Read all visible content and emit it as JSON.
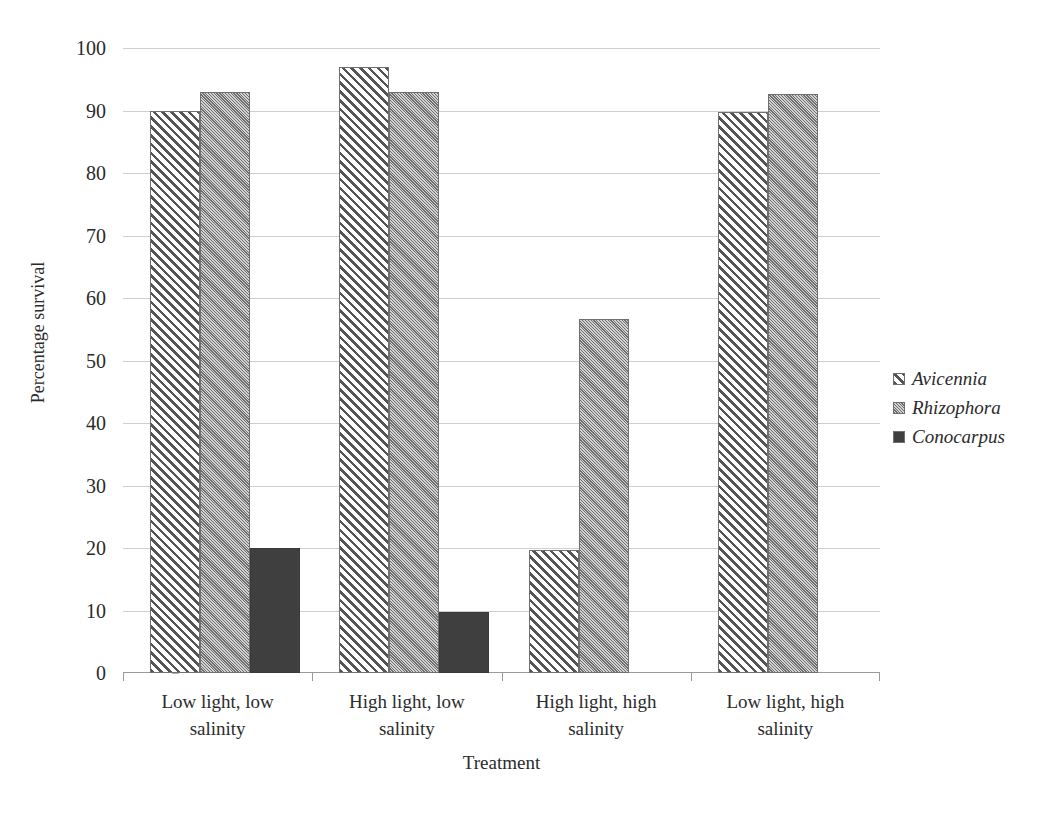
{
  "chart_data": {
    "type": "bar",
    "title": "",
    "xlabel": "Treatment",
    "ylabel": "Percentage survival",
    "ylim": [
      0,
      100
    ],
    "ytick_step": 10,
    "yticks": [
      0,
      10,
      20,
      30,
      40,
      50,
      60,
      70,
      80,
      90,
      100
    ],
    "ytick_labels": [
      "0",
      "10",
      "20",
      "30",
      "40",
      "50",
      "60",
      "70",
      "80",
      "90",
      "100"
    ],
    "grid": true,
    "legend_position": "right",
    "categories": [
      "Low light, low salinity",
      "High light, low salinity",
      "High light, high salinity",
      "Low light, high salinity"
    ],
    "category_lines": [
      [
        "Low light, low",
        "salinity"
      ],
      [
        "High light, low",
        "salinity"
      ],
      [
        "High light, high",
        "salinity"
      ],
      [
        "Low light, high",
        "salinity"
      ]
    ],
    "series": [
      {
        "name": "Avicennia",
        "pattern": "diagonal-hatch-wide",
        "color": "#545454",
        "values": [
          90.0,
          97.0,
          19.7,
          89.7
        ]
      },
      {
        "name": "Rhizophora",
        "pattern": "diagonal-hatch-fine",
        "color": "#bdbdbd",
        "values": [
          93.0,
          93.0,
          56.6,
          92.7
        ]
      },
      {
        "name": "Conocarpus",
        "pattern": "solid",
        "color": "#3f3f3f",
        "values": [
          20.0,
          9.8,
          0.0,
          0.0
        ]
      }
    ]
  },
  "legend": {
    "items": [
      {
        "label": "Avicennia",
        "pattern": "diagonal-hatch-wide"
      },
      {
        "label": "Rhizophora",
        "pattern": "diagonal-hatch-fine"
      },
      {
        "label": "Conocarpus",
        "pattern": "solid"
      }
    ]
  },
  "axes": {
    "x_title": "Treatment",
    "y_title": "Percentage survival"
  }
}
